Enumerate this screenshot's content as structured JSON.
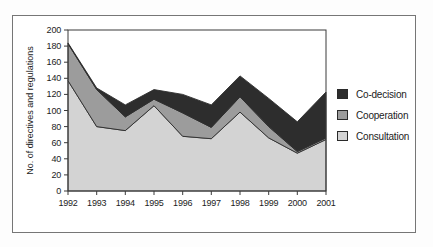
{
  "figure": {
    "frame_border_color": "#767676",
    "background": "#ffffff"
  },
  "chart_data": {
    "type": "area",
    "stacked": true,
    "title": "",
    "xlabel": "",
    "ylabel": "No. of directives and regulations",
    "categories": [
      "1992",
      "1993",
      "1994",
      "1995",
      "1996",
      "1997",
      "1998",
      "1999",
      "2000",
      "2001"
    ],
    "series": [
      {
        "name": "Consultation",
        "color": "#d3d3d3",
        "values": [
          137,
          80,
          75,
          106,
          68,
          65,
          98,
          66,
          47,
          64
        ]
      },
      {
        "name": "Cooperation",
        "color": "#9c9c9c",
        "values": [
          46,
          46,
          17,
          8,
          29,
          14,
          19,
          14,
          2,
          2
        ]
      },
      {
        "name": "Co-decision",
        "color": "#2d2d2d",
        "values": [
          1,
          2,
          15,
          12,
          23,
          28,
          26,
          35,
          37,
          57
        ]
      }
    ],
    "stacked_totals": [
      184,
      128,
      107,
      126,
      120,
      107,
      143,
      115,
      86,
      123
    ],
    "ylim": [
      0,
      200
    ],
    "ytick_step": 20,
    "yticks": [
      0,
      20,
      40,
      60,
      80,
      100,
      120,
      140,
      160,
      180,
      200
    ],
    "grid": false,
    "legend_position": "right",
    "legend_order": [
      "Co-decision",
      "Cooperation",
      "Consultation"
    ],
    "outline_color": "#2e2e2e",
    "axis_color": "#3a3a3a"
  }
}
